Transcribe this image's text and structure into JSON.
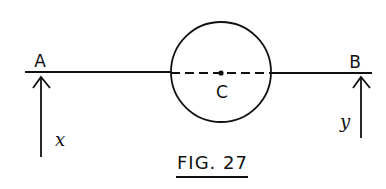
{
  "figure": {
    "caption": "FIG. 27",
    "points": {
      "left_end": "A",
      "right_end": "B",
      "center": "C"
    },
    "forces": {
      "at_A": "x",
      "at_B": "y"
    },
    "colors": {
      "ink": "#111111",
      "background": "#ffffff"
    }
  }
}
